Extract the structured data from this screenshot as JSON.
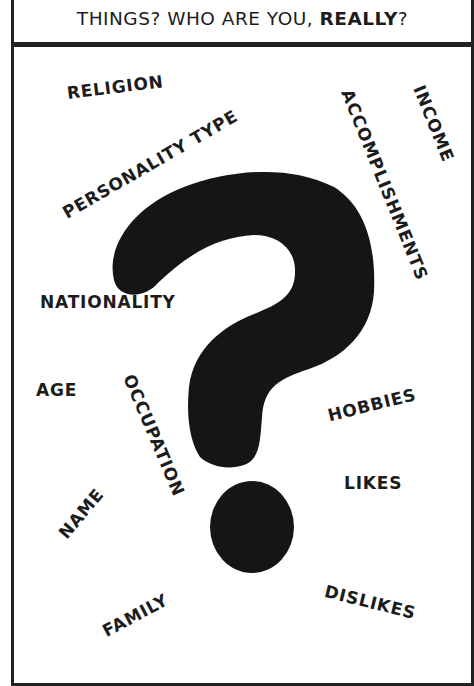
{
  "caption": {
    "prefix": "THINGS? WHO ARE YOU, ",
    "emphasis": "REALLY",
    "suffix": "?"
  },
  "panel": {
    "central_icon": "question-mark-icon",
    "words": [
      {
        "id": "religion",
        "label": "RELIGION"
      },
      {
        "id": "personality-type",
        "label": "PERSONALITY TYPE"
      },
      {
        "id": "accomplishments",
        "label": "ACCOMPLISHMENTS"
      },
      {
        "id": "income",
        "label": "INCOME"
      },
      {
        "id": "nationality",
        "label": "NATIONALITY"
      },
      {
        "id": "age",
        "label": "AGE"
      },
      {
        "id": "occupation",
        "label": "OCCUPATION"
      },
      {
        "id": "hobbies",
        "label": "HOBBIES"
      },
      {
        "id": "likes",
        "label": "LIKES"
      },
      {
        "id": "name",
        "label": "NAME"
      },
      {
        "id": "family",
        "label": "FAMILY"
      },
      {
        "id": "dislikes",
        "label": "DISLIKES"
      }
    ]
  },
  "colors": {
    "ink": "#1c1c1c",
    "border": "#222222",
    "background": "#ffffff"
  }
}
